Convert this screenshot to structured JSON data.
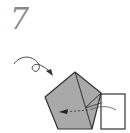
{
  "step": {
    "number": "7"
  },
  "diagram": {
    "colors": {
      "paper_colored": "#a9a9a9",
      "paper_white": "#ffffff",
      "line": "#333333"
    },
    "icons": {
      "turn_over_arrow": "loop-arrow-icon",
      "fold_arrow": "fold-arrow-icon"
    }
  }
}
